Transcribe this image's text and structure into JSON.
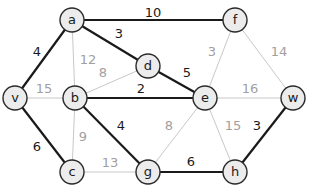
{
  "diagram": {
    "type": "weighted-graph",
    "nodes": [
      {
        "id": "a",
        "label": "a",
        "x": 72,
        "y": 20
      },
      {
        "id": "f",
        "label": "f",
        "x": 235,
        "y": 20
      },
      {
        "id": "d",
        "label": "d",
        "x": 148,
        "y": 66
      },
      {
        "id": "v",
        "label": "v",
        "x": 15,
        "y": 98
      },
      {
        "id": "b",
        "label": "b",
        "x": 75,
        "y": 98
      },
      {
        "id": "e",
        "label": "e",
        "x": 205,
        "y": 98
      },
      {
        "id": "w",
        "label": "w",
        "x": 293,
        "y": 98
      },
      {
        "id": "c",
        "label": "c",
        "x": 72,
        "y": 172
      },
      {
        "id": "g",
        "label": "g",
        "x": 148,
        "y": 172
      },
      {
        "id": "h",
        "label": "h",
        "x": 235,
        "y": 172
      }
    ],
    "edges": [
      {
        "from": "a",
        "to": "f",
        "weight": "10",
        "highlight": true,
        "lx": 153,
        "ly": 12
      },
      {
        "from": "a",
        "to": "d",
        "weight": "3",
        "highlight": true,
        "lx": 119,
        "ly": 33
      },
      {
        "from": "a",
        "to": "v",
        "weight": "4",
        "highlight": true,
        "lx": 37,
        "ly": 51
      },
      {
        "from": "a",
        "to": "b",
        "weight": "12",
        "highlight": false,
        "lx": 88,
        "ly": 59
      },
      {
        "from": "d",
        "to": "b",
        "weight": "8",
        "highlight": false,
        "lx": 103,
        "ly": 72
      },
      {
        "from": "d",
        "to": "e",
        "weight": "5",
        "highlight": true,
        "lx": 187,
        "ly": 72
      },
      {
        "from": "b",
        "to": "e",
        "weight": "2",
        "highlight": true,
        "lx": 141,
        "ly": 88
      },
      {
        "from": "v",
        "to": "b",
        "weight": "15",
        "highlight": false,
        "lx": 44,
        "ly": 88
      },
      {
        "from": "f",
        "to": "e",
        "weight": "3",
        "highlight": false,
        "lx": 212,
        "ly": 51
      },
      {
        "from": "f",
        "to": "w",
        "weight": "14",
        "highlight": false,
        "lx": 279,
        "ly": 51
      },
      {
        "from": "e",
        "to": "w",
        "weight": "16",
        "highlight": false,
        "lx": 250,
        "ly": 88
      },
      {
        "from": "v",
        "to": "c",
        "weight": "6",
        "highlight": true,
        "lx": 37,
        "ly": 146
      },
      {
        "from": "b",
        "to": "c",
        "weight": "9",
        "highlight": false,
        "lx": 83,
        "ly": 136
      },
      {
        "from": "b",
        "to": "g",
        "weight": "4",
        "highlight": true,
        "lx": 121,
        "ly": 125
      },
      {
        "from": "c",
        "to": "g",
        "weight": "13",
        "highlight": false,
        "lx": 110,
        "ly": 162
      },
      {
        "from": "e",
        "to": "g",
        "weight": "8",
        "highlight": false,
        "lx": 169,
        "ly": 125
      },
      {
        "from": "e",
        "to": "h",
        "weight": "15",
        "highlight": false,
        "lx": 233,
        "ly": 125
      },
      {
        "from": "w",
        "to": "h",
        "weight": "3",
        "highlight": true,
        "lx": 257,
        "ly": 125
      },
      {
        "from": "g",
        "to": "h",
        "weight": "6",
        "highlight": true,
        "lx": 191,
        "ly": 161
      }
    ]
  }
}
